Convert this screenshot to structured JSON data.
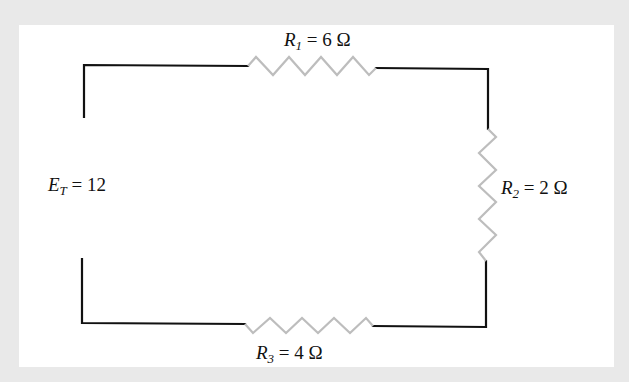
{
  "diagram": {
    "type": "series-circuit",
    "source": {
      "symbol": "E",
      "subscript": "T",
      "equals": "=",
      "value": "12"
    },
    "resistors": [
      {
        "id": "R1",
        "symbol": "R",
        "subscript": "1",
        "equals": "=",
        "value": "6 Ω",
        "position": "top"
      },
      {
        "id": "R2",
        "symbol": "R",
        "subscript": "2",
        "equals": "=",
        "value": "2 Ω",
        "position": "right"
      },
      {
        "id": "R3",
        "symbol": "R",
        "subscript": "3",
        "equals": "=",
        "value": "4 Ω",
        "position": "bottom"
      }
    ],
    "colors": {
      "wire": "#111111",
      "resistor": "#bdbdbd",
      "panel": "#ffffff",
      "background": "#e9e9e9"
    }
  }
}
